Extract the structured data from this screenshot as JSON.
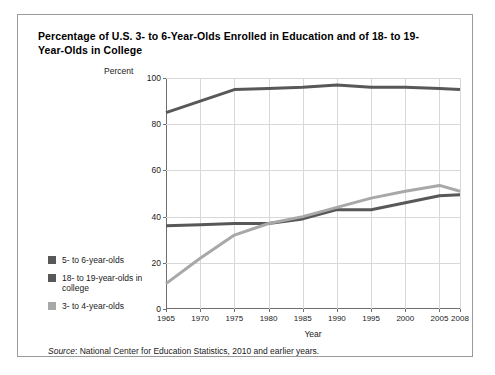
{
  "title": "Percentage of U.S. 3- to 6-Year-Olds Enrolled in Education and of 18- to 19-Year-Olds in College",
  "y_axis_title": "Percent",
  "source": {
    "label": "Source",
    "separator": ":",
    "text": "National Center for Education Statistics, 2010 and earlier years."
  },
  "legend": {
    "items": [
      {
        "label": "5- to 6-year-olds",
        "color": "#585858"
      },
      {
        "label": "18- to 19-year-olds in college",
        "color": "#585858"
      },
      {
        "label": "3- to 4-year-olds",
        "color": "#a8a8a8"
      }
    ]
  },
  "chart_data": {
    "type": "line",
    "title": "Percentage of U.S. 3- to 6-Year-Olds Enrolled in Education and of 18- to 19-Year-Olds in College",
    "xlabel": "Year",
    "ylabel": "Percent",
    "xlim": [
      1965,
      2008
    ],
    "ylim": [
      0,
      100
    ],
    "grid": true,
    "legend_position": "left",
    "x_ticks": [
      1965,
      1970,
      1975,
      1980,
      1985,
      1990,
      1995,
      2000,
      2005,
      2008
    ],
    "y_ticks": [
      0,
      20,
      40,
      60,
      80,
      100
    ],
    "x": [
      1965,
      1970,
      1975,
      1980,
      1985,
      1990,
      1995,
      2000,
      2005,
      2008
    ],
    "series": [
      {
        "name": "5- to 6-year-olds",
        "color": "#585858",
        "values": [
          85,
          90,
          95,
          95.5,
          96,
          97,
          96,
          96,
          95.5,
          95
        ]
      },
      {
        "name": "18- to 19-year-olds in college",
        "color": "#585858",
        "values": [
          36,
          36.5,
          37,
          37,
          39,
          43,
          43,
          46,
          49,
          49.5
        ]
      },
      {
        "name": "3- to 4-year-olds",
        "color": "#a8a8a8",
        "values": [
          11,
          22,
          32,
          37,
          40,
          44,
          48,
          51,
          53.5,
          51
        ]
      }
    ]
  }
}
